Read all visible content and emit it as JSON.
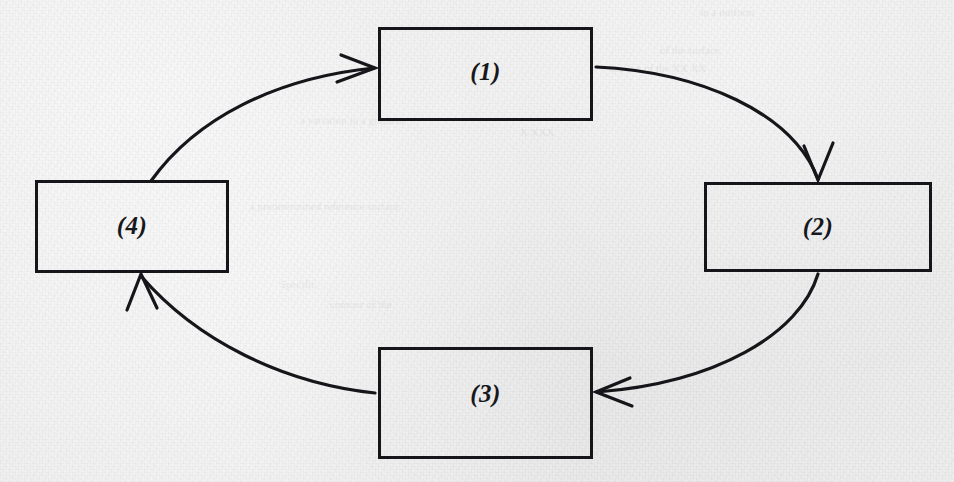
{
  "page": {
    "width": 954,
    "height": 482,
    "background_color": "#f0f0f0",
    "ink_color": "#15151a",
    "medium": "scanned paper with bleed-through ghost text"
  },
  "diagram": {
    "type": "cycle",
    "direction": "clockwise",
    "node_count": 4,
    "edge_count": 4,
    "nodes": [
      {
        "id": "1",
        "name": "box-1",
        "label": "(1)",
        "position": "top-center",
        "x": 378,
        "y": 27,
        "width": 215,
        "height": 94
      },
      {
        "id": "2",
        "name": "box-2",
        "label": "(2)",
        "position": "right",
        "x": 704,
        "y": 182,
        "width": 228,
        "height": 90
      },
      {
        "id": "3",
        "name": "box-3",
        "label": "(3)",
        "position": "bottom-center",
        "x": 378,
        "y": 347,
        "width": 215,
        "height": 112
      },
      {
        "id": "4",
        "name": "box-4",
        "label": "(4)",
        "position": "left",
        "x": 35,
        "y": 180,
        "width": 194,
        "height": 93
      }
    ],
    "edges": [
      {
        "name": "arrow-4-to-1",
        "from": "4",
        "to": "1",
        "style": "curved",
        "arrowhead": "open-v",
        "direction": "right"
      },
      {
        "name": "arrow-1-to-2",
        "from": "1",
        "to": "2",
        "style": "curved",
        "arrowhead": "open-v",
        "direction": "down"
      },
      {
        "name": "arrow-2-to-3",
        "from": "2",
        "to": "3",
        "style": "curved",
        "arrowhead": "open-v",
        "direction": "left"
      },
      {
        "name": "arrow-3-to-4",
        "from": "3",
        "to": "4",
        "style": "curved",
        "arrowhead": "open-v",
        "direction": "up"
      }
    ]
  },
  "ghost_text": [
    {
      "text": "in a uniform",
      "x": 700,
      "y": 6,
      "size": 11
    },
    {
      "text": "of the surface",
      "x": 660,
      "y": 44,
      "size": 11
    },
    {
      "text": "section of the XX XX",
      "x": 610,
      "y": 62,
      "size": 11
    },
    {
      "text": "a variation in a gradient",
      "x": 300,
      "y": 114,
      "size": 11
    },
    {
      "text": "a predetermined reference surface",
      "x": 250,
      "y": 200,
      "size": 11
    },
    {
      "text": "Specific",
      "x": 280,
      "y": 278,
      "size": 11
    },
    {
      "text": "contour of the",
      "x": 330,
      "y": 298,
      "size": 11
    },
    {
      "text": "X XXX",
      "x": 520,
      "y": 126,
      "size": 11
    }
  ]
}
